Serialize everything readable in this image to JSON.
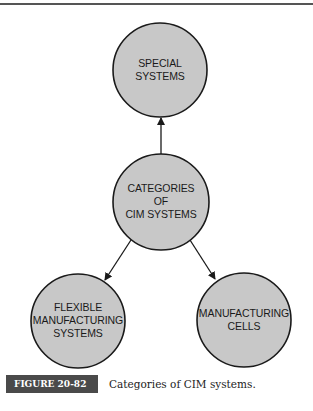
{
  "diagram": {
    "nodes": [
      {
        "id": "special",
        "label_lines": [
          "SPECIAL",
          "SYSTEMS"
        ],
        "cx": 160,
        "cy": 70,
        "r": 47
      },
      {
        "id": "categories",
        "label_lines": [
          "CATEGORIES",
          "OF",
          "CIM SYSTEMS"
        ],
        "cx": 161,
        "cy": 202,
        "r": 48
      },
      {
        "id": "fms",
        "label_lines": [
          "FLEXIBLE",
          "MANUFACTURING",
          "SYSTEMS"
        ],
        "cx": 78,
        "cy": 321,
        "r": 47
      },
      {
        "id": "cells",
        "label_lines": [
          "MANUFACTURING",
          "CELLS"
        ],
        "cx": 244,
        "cy": 320,
        "r": 47
      }
    ],
    "edges": [
      {
        "from": "categories",
        "to": "special"
      },
      {
        "from": "categories",
        "to": "fms"
      },
      {
        "from": "categories",
        "to": "cells"
      }
    ],
    "node_fill": "#c8c8c8",
    "node_stroke": "#1a1a1a"
  },
  "caption": {
    "figure_label": "FIGURE 20-82",
    "text": "Categories of CIM systems."
  }
}
